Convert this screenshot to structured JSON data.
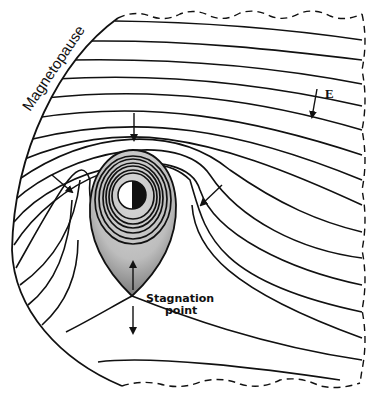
{
  "diagram": {
    "labels": {
      "magnetopause": "Magnetopause",
      "electric_field": "E",
      "stagnation_line1": "Stagnation",
      "stagnation_line2": "point"
    },
    "elements": {
      "earth": "earth-icon (half light / half dark disc)",
      "plasmasphere": "shaded teardrop region with concentric closed contours",
      "field_lines": "equipotential / convection flow lines",
      "boundary": "dashed outer boundary (open magnetotail side)",
      "arrows": [
        "top-arrow-down",
        "left-arrow-inward",
        "right-arrow-inward",
        "E-field-arrow",
        "stagnation-arrow-up",
        "stagnation-arrow-down"
      ]
    },
    "colors": {
      "line": "#111111",
      "shade_light": "#c8c8c8",
      "shade_dark": "#7a7a7a",
      "background": "#ffffff"
    }
  }
}
